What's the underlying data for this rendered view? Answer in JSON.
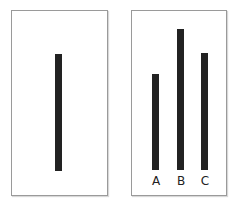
{
  "figure": {
    "colors": {
      "bar": "#222222",
      "border": "#9a9a9a",
      "background": "#ffffff"
    },
    "reference_card": {
      "line": {
        "top": 54,
        "bottom": 171,
        "length_px": 117
      }
    },
    "comparison_card": {
      "lines": [
        {
          "label": "A",
          "top": 74,
          "bottom": 170,
          "length_px": 96
        },
        {
          "label": "B",
          "top": 29,
          "bottom": 170,
          "length_px": 141
        },
        {
          "label": "C",
          "top": 53,
          "bottom": 170,
          "length_px": 117
        }
      ]
    }
  }
}
